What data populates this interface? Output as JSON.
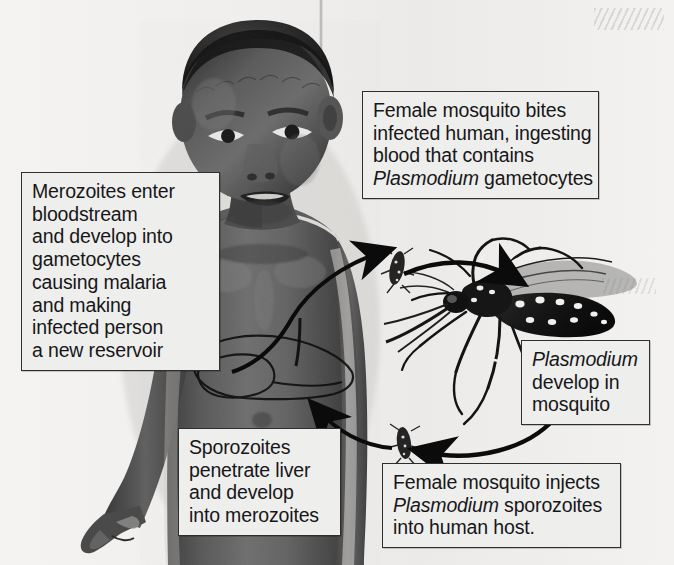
{
  "diagram": {
    "background_color": "#f2f1ef",
    "box_fill_color": "#eeeeec",
    "box_border_color": "#2e2e2e",
    "text_color": "#17171a"
  },
  "callouts": {
    "bite": {
      "name": "female-mosquito-bites",
      "lines": [
        "Female mosquito bites",
        "infected human, ingesting",
        "blood that contains"
      ],
      "italic_term": "Plasmodium",
      "last_line_rest": " gametocytes"
    },
    "merozoites": {
      "name": "merozoites-enter-bloodstream",
      "lines": [
        "Merozoites enter",
        "bloodstream",
        "and develop into",
        "gametocytes",
        "causing malaria",
        "and making",
        "infected person",
        "a new reservoir"
      ]
    },
    "develop": {
      "name": "plasmodium-develop-in-mosquito",
      "italic_term": "Plasmodium",
      "lines": [
        "develop in",
        "mosquito"
      ]
    },
    "sporozoites": {
      "name": "sporozoites-penetrate-liver",
      "lines": [
        "Sporozoites",
        "penetrate liver",
        "and develop",
        "into merozoites"
      ]
    },
    "inject": {
      "name": "female-mosquito-injects",
      "first_line": "Female mosquito injects",
      "italic_term": "Plasmodium",
      "second_line_rest": " sporozoites",
      "lines": [
        "into human host."
      ]
    }
  },
  "figures": {
    "child": "malaria-infected-child-illustration",
    "mosquito": "aedes-mosquito-illustration",
    "liver": "liver-outline-overlay",
    "bite_mark_shoulder": "mosquito-on-shoulder",
    "bite_mark_arm": "mosquito-on-forearm"
  },
  "arrows": [
    {
      "name": "arrow-human-to-mosquito",
      "direction": "clockwise-top"
    },
    {
      "name": "arrow-mosquito-to-human",
      "direction": "counter-clockwise-bottom"
    },
    {
      "name": "arrow-bloodstream-to-shoulder",
      "direction": "up-right"
    },
    {
      "name": "arrow-liver-to-abdomen",
      "direction": "up-left"
    }
  ]
}
